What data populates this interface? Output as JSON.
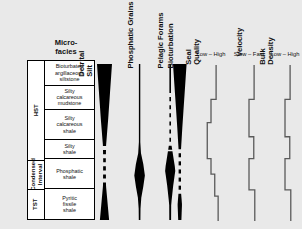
{
  "figure": {
    "background": "#e9e9e9",
    "ink": "#000000",
    "curve_color": "#5a5a5a"
  },
  "microfacies": {
    "header": "Micro-\nfacies",
    "header_line1": "Micro-",
    "header_line2": "facies",
    "systems_tracts": [
      {
        "label": "HST",
        "top_pct": 0,
        "height_pct": 62.5
      },
      {
        "label": "Condensed\nInterval",
        "label_line1": "Condensed",
        "label_line2": "Interval",
        "top_pct": 62.5,
        "height_pct": 18.75
      },
      {
        "label": "TST",
        "top_pct": 81.25,
        "height_pct": 18.75
      }
    ],
    "cells": [
      {
        "text": "Bioturbated argillaceous siltstone",
        "lines": [
          "Bioturbated",
          "argillaceous",
          "siltstone"
        ],
        "height_pct": 15.6
      },
      {
        "text": "Silty calcareous mudstone",
        "lines": [
          "Silty",
          "calcareous",
          "mudstone"
        ],
        "height_pct": 15.6
      },
      {
        "text": "Silty calcareous shale",
        "lines": [
          "Silty",
          "calcareous",
          "shale"
        ],
        "height_pct": 18.8
      },
      {
        "text": "Silty shale",
        "lines": [
          "Silty",
          "shale"
        ],
        "height_pct": 12.5
      },
      {
        "text": "Phosphatic shale",
        "lines": [
          "Phosphatic",
          "shale"
        ],
        "height_pct": 18.8
      },
      {
        "text": "Pyritic fissile shale",
        "lines": [
          "Pyritic",
          "fissile",
          "shale"
        ],
        "height_pct": 18.7
      }
    ]
  },
  "abundance_columns": [
    {
      "name": "detrital-silt",
      "title": "Detrital Silt",
      "title_lines": [
        "Detrital",
        "Silt"
      ],
      "axis_x": 104,
      "half_widths": [
        {
          "d": 0.0,
          "w": 7.5
        },
        {
          "d": 0.36,
          "w": 3.6
        },
        {
          "d": 0.52,
          "w": 1.6
        },
        {
          "d": 0.62,
          "w": 1.3
        },
        {
          "d": 0.78,
          "w": 1.5
        },
        {
          "d": 1.0,
          "w": 4.6
        }
      ],
      "dashed_from": 0.5,
      "dashed_to": 0.76
    },
    {
      "name": "phosphatic-grains",
      "title": "Phosphatic Grains",
      "title_lines": [
        "Phosphatic Grains"
      ],
      "axis_x": 140,
      "half_widths": [
        {
          "d": 0.0,
          "w": 0.7
        },
        {
          "d": 0.55,
          "w": 0.7
        },
        {
          "d": 0.7,
          "w": 5.6
        },
        {
          "d": 0.8,
          "w": 3.4
        },
        {
          "d": 0.88,
          "w": 1.0
        },
        {
          "d": 1.0,
          "w": 0.8
        }
      ],
      "dashed_from": null,
      "dashed_to": null
    },
    {
      "name": "pelagic-forams",
      "title": "Pelagic Forams",
      "title_lines": [
        "Pelagic Forams"
      ],
      "axis_x": 170,
      "half_widths": [
        {
          "d": 0.0,
          "w": 0.8
        },
        {
          "d": 0.5,
          "w": 0.8
        },
        {
          "d": 0.68,
          "w": 5.2
        },
        {
          "d": 0.78,
          "w": 3.0
        },
        {
          "d": 0.9,
          "w": 1.0
        },
        {
          "d": 1.0,
          "w": 0.9
        }
      ],
      "dashed_from": 0.16,
      "dashed_to": 0.56
    },
    {
      "name": "bioturbation",
      "title": "Bioturbation",
      "title_lines": [
        "Bioturbation"
      ],
      "axis_x": 180,
      "half_widths": [
        {
          "d": 0.0,
          "w": 6.8
        },
        {
          "d": 0.4,
          "w": 2.6
        },
        {
          "d": 0.55,
          "w": 1.2
        },
        {
          "d": 0.82,
          "w": 1.2
        },
        {
          "d": 0.9,
          "w": 2.2
        },
        {
          "d": 1.0,
          "w": 1.6
        }
      ],
      "dashed_from": 0.52,
      "dashed_to": 0.84
    }
  ],
  "log_columns": [
    {
      "name": "seal-quality",
      "title": "Seal Quality",
      "title_lines": [
        "Seal",
        "Quality"
      ],
      "scale_left": "Low",
      "scale_right": "High",
      "scale_text": "Low – High",
      "base_x": 211,
      "points": [
        {
          "d": 0.0,
          "v": 0.3
        },
        {
          "d": 0.22,
          "v": 0.3
        },
        {
          "d": 0.22,
          "v": 0.0
        },
        {
          "d": 0.37,
          "v": 0.0
        },
        {
          "d": 0.37,
          "v": -0.22
        },
        {
          "d": 0.6,
          "v": -0.22
        },
        {
          "d": 0.6,
          "v": 0.0
        },
        {
          "d": 0.7,
          "v": 0.0
        },
        {
          "d": 0.7,
          "v": 0.22
        },
        {
          "d": 0.84,
          "v": 0.22
        },
        {
          "d": 0.84,
          "v": 0.42
        },
        {
          "d": 1.0,
          "v": 0.42
        }
      ]
    },
    {
      "name": "velocity",
      "title": "Velocity",
      "title_lines": [
        "Velocity"
      ],
      "scale_left": "Slow",
      "scale_right": "Fast",
      "scale_text": "Slow – Fast",
      "base_x": 249,
      "points": [
        {
          "d": 0.0,
          "v": 0.3
        },
        {
          "d": 0.22,
          "v": 0.3
        },
        {
          "d": 0.22,
          "v": 0.0
        },
        {
          "d": 0.46,
          "v": 0.0
        },
        {
          "d": 0.46,
          "v": 0.28
        },
        {
          "d": 0.6,
          "v": 0.28
        },
        {
          "d": 0.6,
          "v": 0.0
        },
        {
          "d": 0.8,
          "v": 0.0
        },
        {
          "d": 0.8,
          "v": 0.34
        },
        {
          "d": 1.0,
          "v": 0.34
        }
      ]
    },
    {
      "name": "bulk-density",
      "title": "Bulk Density",
      "title_lines": [
        "Bulk",
        "Density"
      ],
      "scale_left": "Low",
      "scale_right": "High",
      "scale_text": "Low – High",
      "base_x": 285,
      "points": [
        {
          "d": 0.0,
          "v": 0.3
        },
        {
          "d": 0.22,
          "v": 0.3
        },
        {
          "d": 0.22,
          "v": 0.0
        },
        {
          "d": 0.46,
          "v": 0.0
        },
        {
          "d": 0.46,
          "v": 0.28
        },
        {
          "d": 0.6,
          "v": 0.28
        },
        {
          "d": 0.6,
          "v": 0.0
        },
        {
          "d": 0.8,
          "v": 0.0
        },
        {
          "d": 0.8,
          "v": 0.34
        },
        {
          "d": 1.0,
          "v": 0.34
        }
      ]
    }
  ]
}
